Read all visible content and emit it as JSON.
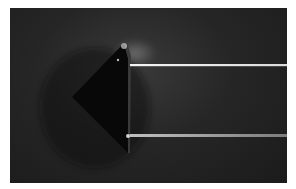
{
  "image": {
    "description": "Glass prism on dark background with two light beams emerging horizontally to the right",
    "colors": {
      "background": "#ffffff",
      "photo_bg": "#222222",
      "prism": "#0a0a0a",
      "beam": "#e8e8e8"
    },
    "elements": {
      "prism": "triangular glass prism",
      "beam_top": "upper light beam",
      "beam_bottom": "lower light beam"
    }
  }
}
